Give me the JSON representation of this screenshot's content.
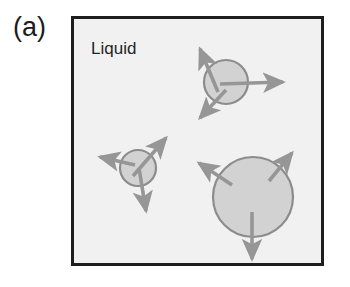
{
  "figure": {
    "panel_label": "(a)",
    "caption_region_label": "Liquid",
    "background_color": "#ffffff",
    "box": {
      "fill_color": "#f1f1f1",
      "border_color": "#1e1e1e",
      "border_width_px": 3,
      "x": 71,
      "y": 16,
      "width": 253,
      "height": 250
    },
    "colors": {
      "particle_fill": "#d2d2d2",
      "particle_stroke": "#8c8c8c",
      "arrow_color": "#969696",
      "text_color": "#1c1c1c"
    },
    "particles": [
      {
        "id": "particle-top-right",
        "cx": 226,
        "cy": 82,
        "r": 22,
        "arrows": [
          {
            "id": "arrow-top-right-northeast",
            "direction": "northeast",
            "x1": 218,
            "y1": 92,
            "x2": 200,
            "y2": 49
          },
          {
            "id": "arrow-top-right-east",
            "direction": "east",
            "x1": 220,
            "y1": 84,
            "x2": 283,
            "y2": 82
          },
          {
            "id": "arrow-top-right-southwest",
            "direction": "southwest",
            "x1": 226,
            "y1": 90,
            "x2": 200,
            "y2": 118
          }
        ]
      },
      {
        "id": "particle-middle-left",
        "cx": 138,
        "cy": 168,
        "r": 18,
        "arrows": [
          {
            "id": "arrow-middle-left-northeast",
            "direction": "northeast",
            "x1": 133,
            "y1": 176,
            "x2": 166,
            "y2": 138
          },
          {
            "id": "arrow-middle-left-west",
            "direction": "west",
            "x1": 135,
            "y1": 165,
            "x2": 100,
            "y2": 157
          },
          {
            "id": "arrow-middle-left-south",
            "direction": "south",
            "x1": 139,
            "y1": 168,
            "x2": 146,
            "y2": 211
          }
        ]
      },
      {
        "id": "particle-large-bottom",
        "cx": 253,
        "cy": 197,
        "r": 40,
        "arrows": [
          {
            "id": "arrow-large-northeast",
            "direction": "northeast",
            "x1": 269,
            "y1": 181,
            "x2": 292,
            "y2": 153
          },
          {
            "id": "arrow-large-northwest",
            "direction": "northwest",
            "x1": 232,
            "y1": 185,
            "x2": 199,
            "y2": 163
          },
          {
            "id": "arrow-large-south",
            "direction": "south",
            "x1": 252,
            "y1": 212,
            "x2": 252,
            "y2": 259
          }
        ]
      }
    ]
  }
}
